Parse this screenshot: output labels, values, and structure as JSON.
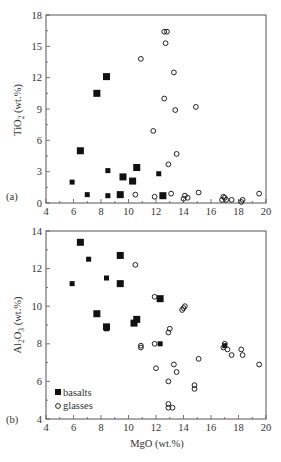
{
  "chart_data": [
    {
      "type": "scatter",
      "panel_label": "(a)",
      "title": "",
      "xlabel": "MgO (wt.%)",
      "ylabel": "TiO2 (wt.%)",
      "xlim": [
        4,
        20
      ],
      "ylim": [
        0,
        18
      ],
      "xticks": [
        4,
        6,
        8,
        10,
        12,
        14,
        16,
        18,
        20
      ],
      "yticks": [
        0,
        3,
        6,
        9,
        12,
        15,
        18
      ],
      "grid": false,
      "series": [
        {
          "name": "basalts",
          "marker": "filled-square",
          "points": [
            [
              6.5,
              5.0,
              "l"
            ],
            [
              7.7,
              10.5,
              "l"
            ],
            [
              8.4,
              12.1,
              "l"
            ],
            [
              5.9,
              2.0,
              "s"
            ],
            [
              7.0,
              0.8,
              "s"
            ],
            [
              8.5,
              3.1,
              "s"
            ],
            [
              8.5,
              0.7,
              "s"
            ],
            [
              9.4,
              0.8,
              "l"
            ],
            [
              9.6,
              2.5,
              "l"
            ],
            [
              10.3,
              2.1,
              "l"
            ],
            [
              10.6,
              3.4,
              "l"
            ],
            [
              12.2,
              2.8,
              "s"
            ],
            [
              12.5,
              0.7,
              "l"
            ]
          ]
        },
        {
          "name": "glasses",
          "marker": "open-circle",
          "points": [
            [
              10.5,
              0.8
            ],
            [
              10.9,
              13.8
            ],
            [
              11.9,
              0.6
            ],
            [
              11.8,
              6.9
            ],
            [
              12.6,
              16.4
            ],
            [
              12.8,
              16.4
            ],
            [
              12.7,
              15.3
            ],
            [
              12.6,
              10.0
            ],
            [
              12.9,
              3.7
            ],
            [
              13.3,
              12.5
            ],
            [
              13.4,
              8.9
            ],
            [
              13.5,
              4.7
            ],
            [
              13.1,
              0.9
            ],
            [
              14.0,
              0.4
            ],
            [
              14.1,
              0.7
            ],
            [
              14.3,
              0.5
            ],
            [
              14.9,
              9.2
            ],
            [
              15.1,
              1.0
            ],
            [
              16.8,
              0.3
            ],
            [
              16.9,
              0.6
            ],
            [
              17.0,
              0.5
            ],
            [
              17.1,
              0.3
            ],
            [
              17.5,
              0.3
            ],
            [
              18.2,
              0.1
            ],
            [
              18.3,
              0.3
            ],
            [
              19.5,
              0.9
            ]
          ]
        }
      ]
    },
    {
      "type": "scatter",
      "panel_label": "(b)",
      "title": "",
      "xlabel": "MgO (wt.%)",
      "ylabel": "Al2O3 (wt.%)",
      "xlim": [
        4,
        20
      ],
      "ylim": [
        4,
        14
      ],
      "xticks": [
        4,
        6,
        8,
        10,
        12,
        14,
        16,
        18,
        20
      ],
      "yticks": [
        4,
        6,
        8,
        10,
        12,
        14
      ],
      "grid": false,
      "legend": {
        "position": "lower-left",
        "entries": [
          "basalts",
          "glasses"
        ]
      },
      "series": [
        {
          "name": "basalts",
          "marker": "filled-square",
          "points": [
            [
              5.9,
              11.2,
              "s"
            ],
            [
              6.5,
              13.4,
              "l"
            ],
            [
              7.1,
              12.5,
              "s"
            ],
            [
              7.7,
              9.6,
              "l"
            ],
            [
              8.4,
              11.5,
              "s"
            ],
            [
              8.4,
              8.9,
              "l"
            ],
            [
              8.4,
              8.8,
              "s"
            ],
            [
              9.4,
              12.7,
              "l"
            ],
            [
              9.4,
              11.2,
              "l"
            ],
            [
              10.4,
              9.1,
              "l"
            ],
            [
              10.6,
              9.3,
              "l"
            ],
            [
              12.3,
              10.4,
              "l"
            ],
            [
              12.3,
              8.0,
              "s"
            ],
            [
              17.0,
              7.9,
              "s"
            ]
          ]
        },
        {
          "name": "glasses",
          "marker": "open-circle",
          "points": [
            [
              10.5,
              12.2
            ],
            [
              10.9,
              7.9
            ],
            [
              10.9,
              7.8
            ],
            [
              11.9,
              10.5
            ],
            [
              11.9,
              8.0
            ],
            [
              12.0,
              6.7
            ],
            [
              12.9,
              8.6
            ],
            [
              13.0,
              8.8
            ],
            [
              12.9,
              6.0
            ],
            [
              13.3,
              6.9
            ],
            [
              13.5,
              6.5
            ],
            [
              12.9,
              4.8
            ],
            [
              12.9,
              4.6
            ],
            [
              13.2,
              4.6
            ],
            [
              13.9,
              9.8
            ],
            [
              14.1,
              10.0
            ],
            [
              14.0,
              9.9
            ],
            [
              14.8,
              5.8
            ],
            [
              14.8,
              5.6
            ],
            [
              15.1,
              7.2
            ],
            [
              16.9,
              7.8
            ],
            [
              17.0,
              8.0
            ],
            [
              17.2,
              7.7
            ],
            [
              17.5,
              7.4
            ],
            [
              18.2,
              7.7
            ],
            [
              18.3,
              7.4
            ],
            [
              19.5,
              6.9
            ]
          ]
        }
      ]
    }
  ],
  "labels": {
    "panel_a": "(a)",
    "panel_b": "(b)",
    "ylabel_a_main": "TiO",
    "ylabel_a_sub": "2",
    "ylabel_a_unit": " (wt.%)",
    "ylabel_b_main": "Al",
    "ylabel_b_sub1": "2",
    "ylabel_b_mid": "O",
    "ylabel_b_sub2": "3",
    "ylabel_b_unit": " (wt.%)",
    "xlabel": "MgO (wt.%)",
    "legend_basalts": "basalts",
    "legend_glasses": "glasses"
  }
}
